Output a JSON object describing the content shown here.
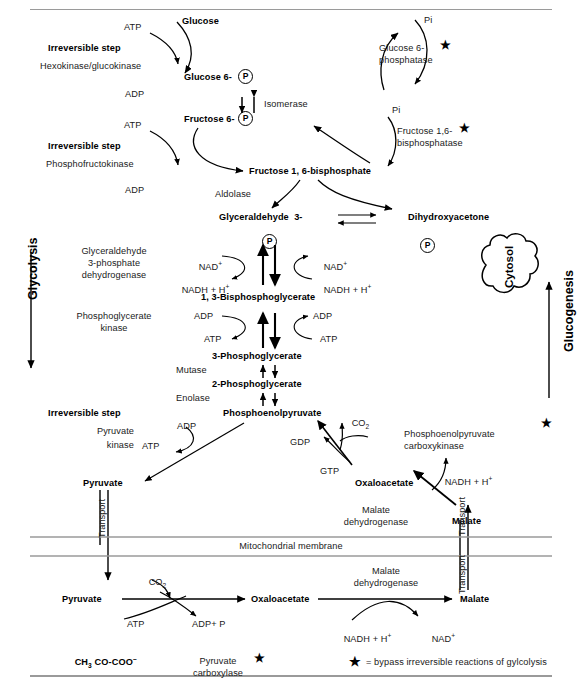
{
  "figure": {
    "top_rule": true,
    "bottom_rule": true
  },
  "pathway_labels": {
    "glycolysis": "Glycolysis",
    "gluconeogenesis": "Glucogenesis",
    "cytosol": "Cytosol",
    "mitochondrial_membrane": "Mitochondrial membrane",
    "transport_left": "Transport",
    "transport_right_upper": "Transport",
    "transport_right_lower": "Transport"
  },
  "metabolites": {
    "glucose": "Glucose",
    "glucose_6": "Glucose 6-",
    "fructose_6": "Fructose 6-",
    "fructose_16_bisphosphate": "Fructose 1, 6-bisphosphate",
    "glyceraldehyde_3": "Glyceraldehyde  3-",
    "dihydroxyacetone": "Dihydroxyacetone",
    "bisphosphoglycerate_13": "1, 3-Bisphosphoglycerate",
    "phosphoglycerate_3": "3-Phosphoglycerate",
    "phosphoglycerate_2": "2-Phosphoglycerate",
    "phosphoenolpyruvate": "Phosphoenolpyruvate",
    "pyruvate_cytosol": "Pyruvate",
    "oxaloacetate_cytosol": "Oxaloacetate",
    "malate_cytosol": "Malate",
    "pyruvate_mito": "Pyruvate",
    "oxaloacetate_mito": "Oxaloacetate",
    "malate_mito": "Malate",
    "pyruvate_structure": "CH",
    "pyruvate_structure_sub": "3",
    "pyruvate_structure_rest": " CO-COO",
    "pyruvate_structure_charge": "–"
  },
  "phosphate_group": "P",
  "enzymes": {
    "irreversible_step_1": "Irreversible step",
    "hexokinase": "Hexokinase/glucokinase",
    "glucose_6_phosphatase_l1": "Glucose 6-",
    "glucose_6_phosphatase_l2": "phosphatase",
    "isomerase": "Isomerase",
    "irreversible_step_2": "Irreversible step",
    "phosphofructokinase": "Phosphofructokinase",
    "fructose_bisphosphatase_l1": "Fructose 1,6-",
    "fructose_bisphosphatase_l2": "bisphosphatase",
    "aldolase": "Aldolase",
    "gapdh_l1": "Glyceraldehyde",
    "gapdh_l2": "3-phosphate",
    "gapdh_l3": "dehydrogenase",
    "pgk_l1": "Phosphoglycerate",
    "pgk_l2": "kinase",
    "mutase": "Mutase",
    "enolase": "Enolase",
    "irreversible_step_3": "Irreversible step",
    "pyruvate_kinase_l1": "Pyruvate",
    "pyruvate_kinase_l2": "kinase",
    "pepck_l1": "Phosphoenolpyruvate",
    "pepck_l2": "carboxykinase",
    "malate_dh_cyto_l1": "Malate",
    "malate_dh_cyto_l2": "dehydrogenase",
    "pyruvate_carboxylase_l1": "Pyruvate",
    "pyruvate_carboxylase_l2": "carboxylase",
    "malate_dh_mito_l1": "Malate",
    "malate_dh_mito_l2": "dehydrogenase"
  },
  "cofactors": {
    "atp_1": "ATP",
    "adp_1": "ADP",
    "pi_1": "Pi",
    "atp_2": "ATP",
    "adp_2": "ADP",
    "pi_2": "Pi",
    "nad_left": "NAD",
    "nad_left_sup": "+",
    "nadh_left": "NADH + H",
    "nadh_left_sup": "+",
    "nad_right": "NAD",
    "nad_right_sup": "+",
    "nadh_right": "NADH + H",
    "nadh_right_sup": "+",
    "adp_left_pgk": "ADP",
    "atp_left_pgk": "ATP",
    "adp_right_pgk": "ADP",
    "atp_right_pgk": "ATP",
    "adp_pk": "ADP",
    "atp_pk": "ATP",
    "co2_pepck": "CO",
    "co2_pepck_sub": "2",
    "gdp": "GDP",
    "gtp": "GTP",
    "nadh_malate_cyto": "NADH + H",
    "nadh_malate_cyto_sup": "+",
    "co2_pc": "CO",
    "co2_pc_sub": "2",
    "atp_pc": "ATP",
    "adp_p_pc": "ADP+ P",
    "nadh_mito": "NADH + H",
    "nadh_mito_sup": "+",
    "nad_mito": "NAD",
    "nad_mito_sup": "+"
  },
  "legend": {
    "star_glyph": "★",
    "text": "= bypass irreversible reactions of gylcolysis"
  },
  "colors": {
    "stroke": "#000000",
    "text": "#1a1a1a",
    "rule": "#9a9a9a",
    "background": "#ffffff"
  }
}
